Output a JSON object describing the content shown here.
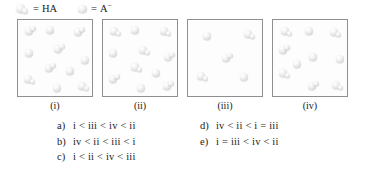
{
  "legend": {
    "items": [
      {
        "icon": "ha-molecule-icon",
        "equals": "=",
        "label": "HA",
        "label_plain": "HA",
        "type": "diatomic"
      },
      {
        "icon": "a-minus-ion-icon",
        "equals": "=",
        "label": "A",
        "superscript": "−",
        "label_plain": "A−",
        "type": "monatomic"
      }
    ]
  },
  "boxes": [
    {
      "id": "i",
      "label": "(i)",
      "counts": {
        "HA": 6,
        "A_minus": 5,
        "total": 11
      },
      "particles": [
        {
          "species": "HA",
          "x": 7,
          "y": 7
        },
        {
          "species": "A_minus",
          "x": 28,
          "y": 6
        },
        {
          "species": "HA",
          "x": 56,
          "y": 8
        },
        {
          "species": "A_minus",
          "x": 7,
          "y": 29
        },
        {
          "species": "HA",
          "x": 36,
          "y": 25
        },
        {
          "species": "A_minus",
          "x": 63,
          "y": 36
        },
        {
          "species": "HA",
          "x": 27,
          "y": 44
        },
        {
          "species": "HA",
          "x": 6,
          "y": 55
        },
        {
          "species": "A_minus",
          "x": 35,
          "y": 64
        },
        {
          "species": "HA",
          "x": 60,
          "y": 62
        },
        {
          "species": "A_minus",
          "x": 48,
          "y": 47
        }
      ]
    },
    {
      "id": "ii",
      "label": "(ii)",
      "counts": {
        "HA": 7,
        "A_minus": 4,
        "total": 11
      },
      "particles": [
        {
          "species": "HA",
          "x": 7,
          "y": 7
        },
        {
          "species": "A_minus",
          "x": 28,
          "y": 6
        },
        {
          "species": "HA",
          "x": 57,
          "y": 7
        },
        {
          "species": "A_minus",
          "x": 6,
          "y": 29
        },
        {
          "species": "HA",
          "x": 36,
          "y": 26
        },
        {
          "species": "HA",
          "x": 61,
          "y": 33
        },
        {
          "species": "HA",
          "x": 28,
          "y": 43
        },
        {
          "species": "HA",
          "x": 6,
          "y": 55
        },
        {
          "species": "A_minus",
          "x": 34,
          "y": 64
        },
        {
          "species": "HA",
          "x": 60,
          "y": 62
        },
        {
          "species": "A_minus",
          "x": 49,
          "y": 49
        }
      ]
    },
    {
      "id": "iii",
      "label": "(iii)",
      "counts": {
        "HA": 3,
        "A_minus": 2,
        "total": 5
      },
      "particles": [
        {
          "species": "A_minus",
          "x": 15,
          "y": 12
        },
        {
          "species": "HA",
          "x": 56,
          "y": 10
        },
        {
          "species": "HA",
          "x": 34,
          "y": 34
        },
        {
          "species": "HA",
          "x": 9,
          "y": 52
        },
        {
          "species": "A_minus",
          "x": 52,
          "y": 53
        }
      ]
    },
    {
      "id": "iv",
      "label": "(iv)",
      "counts": {
        "HA": 6,
        "A_minus": 4,
        "total": 10
      },
      "particles": [
        {
          "species": "HA",
          "x": 8,
          "y": 7
        },
        {
          "species": "A_minus",
          "x": 32,
          "y": 7
        },
        {
          "species": "HA",
          "x": 57,
          "y": 8
        },
        {
          "species": "HA",
          "x": 6,
          "y": 26
        },
        {
          "species": "A_minus",
          "x": 36,
          "y": 33
        },
        {
          "species": "A_minus",
          "x": 63,
          "y": 35
        },
        {
          "species": "HA",
          "x": 6,
          "y": 49
        },
        {
          "species": "HA",
          "x": 35,
          "y": 62
        },
        {
          "species": "HA",
          "x": 59,
          "y": 61
        },
        {
          "species": "A_minus",
          "x": 20,
          "y": 40
        }
      ]
    }
  ],
  "options": {
    "left": [
      {
        "key": "a)",
        "text": "i < iii < iv < ii"
      },
      {
        "key": "b)",
        "text": "iv < ii < iii < i"
      },
      {
        "key": "c)",
        "text": "i < ii < iv < iii"
      }
    ],
    "right": [
      {
        "key": "d)",
        "text": "iv < ii < i = iii"
      },
      {
        "key": "e)",
        "text": "i = iii < iv < ii"
      }
    ]
  }
}
